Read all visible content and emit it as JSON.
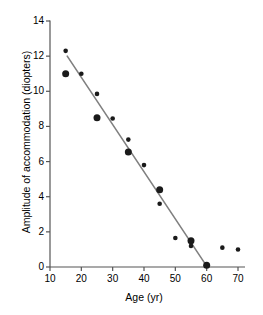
{
  "chart_data": {
    "type": "scatter",
    "title": "",
    "xlabel": "Age (yr)",
    "ylabel": "Amplitude of accommodation (diopters)",
    "xlim": [
      10,
      72
    ],
    "ylim": [
      0,
      14
    ],
    "xticks": [
      10,
      20,
      30,
      40,
      50,
      60,
      70
    ],
    "xtick_labels": [
      "10",
      "20",
      "30",
      "40",
      "50",
      "60",
      "70"
    ],
    "yticks": [
      0,
      2,
      4,
      6,
      8,
      10,
      12,
      14
    ],
    "ytick_labels": [
      "0",
      "2",
      "4",
      "6",
      "8",
      "10",
      "12",
      "14"
    ],
    "grid": false,
    "legend": false,
    "marker_color": "#1a1a1a",
    "line_color": "#808080",
    "axis_color": "#555555",
    "series": [
      {
        "name": "large-markers",
        "marker": "circle",
        "marker_size": 7,
        "points": [
          {
            "x": 15,
            "y": 11.0
          },
          {
            "x": 25,
            "y": 8.5
          },
          {
            "x": 35,
            "y": 6.55
          },
          {
            "x": 45,
            "y": 4.4
          },
          {
            "x": 55,
            "y": 1.5
          },
          {
            "x": 60,
            "y": 0.1
          }
        ]
      },
      {
        "name": "small-markers",
        "marker": "circle",
        "marker_size": 4.6,
        "points": [
          {
            "x": 15,
            "y": 12.3
          },
          {
            "x": 20,
            "y": 11.0
          },
          {
            "x": 25,
            "y": 9.85
          },
          {
            "x": 30,
            "y": 8.45
          },
          {
            "x": 35,
            "y": 7.25
          },
          {
            "x": 40,
            "y": 5.8
          },
          {
            "x": 45,
            "y": 3.6
          },
          {
            "x": 50,
            "y": 1.65
          },
          {
            "x": 55,
            "y": 1.2
          },
          {
            "x": 65,
            "y": 1.1
          },
          {
            "x": 70,
            "y": 1.0
          }
        ]
      }
    ],
    "trendline": {
      "name": "regression-line",
      "x_start": 15.5,
      "y_start": 12.0,
      "x_end": 60.0,
      "y_end": 0.05,
      "color": "#808080",
      "width": 1.6
    }
  }
}
